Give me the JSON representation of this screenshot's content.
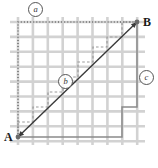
{
  "figure": {
    "type": "grid-path-diagram",
    "background": "#ffffff",
    "grid": {
      "color": "#d2d2d2",
      "line_width": 2.6,
      "cols": 8,
      "rows": 8,
      "x0": 18,
      "y0": 22,
      "x1": 137,
      "y1": 137,
      "cell": 14.9
    },
    "points": [
      {
        "id": "A",
        "label": "A",
        "x": 18,
        "y": 137,
        "dot": true
      },
      {
        "id": "B",
        "label": "B",
        "x": 137,
        "y": 22,
        "dot": true
      }
    ],
    "diagonal": {
      "name": "straight-line-A-to-B",
      "color": "#3a3a3a",
      "width": 1.4,
      "from": [
        18,
        137
      ],
      "to": [
        137,
        22
      ],
      "arrow": "both"
    },
    "paths": [
      {
        "id": "a",
        "label": "a",
        "style": "dotted",
        "color": "#6e6e6e",
        "width": 1.5,
        "description": "up the left edge then right across the top",
        "points": [
          [
            18,
            137
          ],
          [
            18,
            22
          ],
          [
            137,
            22
          ]
        ],
        "label_pos": [
          28,
          2
        ]
      },
      {
        "id": "b",
        "label": "b",
        "style": "dashed",
        "color": "#9a9a9a",
        "width": 1.2,
        "description": "staircase hugging the diagonal",
        "points": [
          [
            18,
            137
          ],
          [
            18,
            122
          ],
          [
            33,
            122
          ],
          [
            33,
            107
          ],
          [
            48,
            107
          ],
          [
            48,
            92
          ],
          [
            63,
            92
          ],
          [
            63,
            77
          ],
          [
            78,
            77
          ],
          [
            78,
            62
          ],
          [
            93,
            62
          ],
          [
            93,
            47
          ],
          [
            107,
            47
          ],
          [
            107,
            37
          ],
          [
            122,
            37
          ],
          [
            122,
            22
          ],
          [
            137,
            22
          ]
        ],
        "label_pos": [
          58,
          74
        ]
      },
      {
        "id": "c",
        "label": "c",
        "style": "solid",
        "color": "#8a8a8a",
        "width": 1.5,
        "description": "along the bottom then stepping up the right side",
        "points": [
          [
            18,
            137
          ],
          [
            122,
            137
          ],
          [
            122,
            107
          ],
          [
            137,
            107
          ],
          [
            137,
            22
          ]
        ],
        "label_pos": [
          139,
          70
        ]
      }
    ]
  }
}
